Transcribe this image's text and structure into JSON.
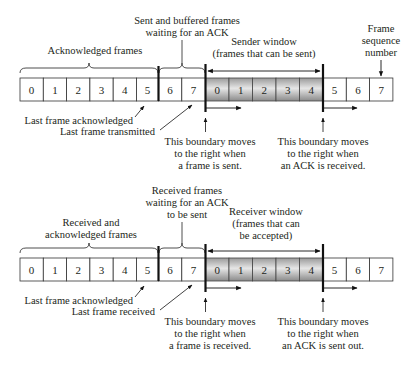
{
  "sender": {
    "frames": [
      "0",
      "1",
      "2",
      "3",
      "4",
      "5",
      "6",
      "7",
      "0",
      "1",
      "2",
      "3",
      "4",
      "5",
      "6",
      "7"
    ],
    "labels": {
      "acknowledged": "Acknowledged frames",
      "buffered_line1": "Sent and buffered frames",
      "buffered_line2": "waiting for an ACK",
      "window_line1": "Sender window",
      "window_line2": "(frames that can be sent)",
      "seq_line1": "Frame",
      "seq_line2": "sequence",
      "seq_line3": "number",
      "last_ack": "Last frame acknowledged",
      "last_tx": "Last frame transmitted",
      "left_boundary_line1": "This boundary moves",
      "left_boundary_line2": "to the right when",
      "left_boundary_line3": "a frame is sent.",
      "right_boundary_line1": "This boundary moves",
      "right_boundary_line2": "to the right when",
      "right_boundary_line3": "an ACK is received."
    }
  },
  "receiver": {
    "frames": [
      "0",
      "1",
      "2",
      "3",
      "4",
      "5",
      "6",
      "7",
      "0",
      "1",
      "2",
      "3",
      "4",
      "5",
      "6",
      "7"
    ],
    "labels": {
      "acknowledged_line1": "Received and",
      "acknowledged_line2": "acknowledged frames",
      "waiting_line1": "Received frames",
      "waiting_line2": "waiting for an ACK",
      "waiting_line3": "to be sent",
      "window_line1": "Receiver window",
      "window_line2": "(frames that can",
      "window_line3": "be accepted)",
      "last_ack": "Last frame acknowledged",
      "last_rx": "Last frame received",
      "left_boundary_line1": "This boundary moves",
      "left_boundary_line2": "to the right when",
      "left_boundary_line3": "a frame is received.",
      "right_boundary_line1": "This boundary moves",
      "right_boundary_line2": "to the right when",
      "right_boundary_line3": "an ACK is sent out."
    }
  }
}
